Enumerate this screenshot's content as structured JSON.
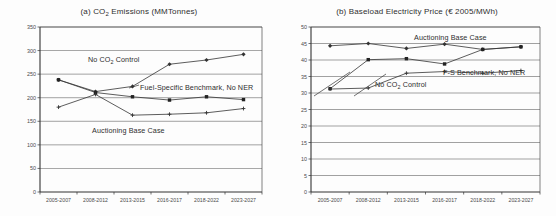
{
  "figure": {
    "name": "two-panel-line-chart-figure",
    "background": "#fdfdfd",
    "ink_color": "#3a3a3a"
  },
  "panels": [
    {
      "key": "a",
      "title_prefix": "(a) CO",
      "title_sub": "2",
      "title_suffix": " Emissions (MMTonnes)",
      "title_plain": "(a) CO2 Emissions (MMTonnes)",
      "series_labels": [
        {
          "text_prefix": "No CO",
          "text_sub": "2",
          "text_suffix": " Control",
          "text_plain": "No CO2 Control",
          "left": 88,
          "top": 55
        },
        {
          "text_prefix": "Fuel-Specific Benchmark, No NER",
          "text_sub": "",
          "text_suffix": "",
          "text_plain": "Fuel-Specific Benchmark, No NER",
          "left": 140,
          "top": 83
        },
        {
          "text_prefix": "Auctioning Base Case",
          "text_sub": "",
          "text_suffix": "",
          "text_plain": "Auctioning Base Case",
          "left": 92,
          "top": 126
        }
      ]
    },
    {
      "key": "b",
      "title_prefix": "(b) Baseload Electricity Price (",
      "title_sub": "",
      "title_suffix": "€ 2005/MWh)",
      "title_plain": "(b) Baseload Electricity Price (€ 2005/MWh)",
      "series_labels": [
        {
          "text_prefix": "Auctioning Base Case",
          "text_sub": "",
          "text_suffix": "",
          "text_plain": "Auctioning Base Case",
          "left": 414,
          "top": 33
        },
        {
          "text_prefix": "F-S Benchmark, No NER",
          "text_sub": "",
          "text_suffix": "",
          "text_plain": "F-S Benchmark, No NER",
          "left": 443,
          "top": 68
        },
        {
          "text_prefix": "No CO",
          "text_sub": "2",
          "text_suffix": " Control",
          "text_plain": "No CO2 Control",
          "left": 375,
          "top": 80
        }
      ]
    }
  ],
  "chart_data": [
    {
      "type": "line",
      "panel": "a",
      "title": "(a) CO2 Emissions (MMTonnes)",
      "xlabel": "",
      "ylabel": "",
      "categories": [
        "2005-2007",
        "2008-2012",
        "2013-2015",
        "2016-2017",
        "2018-2022",
        "2023-2027"
      ],
      "ylim": [
        0,
        350
      ],
      "ytick_step": 50,
      "yticks": [
        0,
        50,
        100,
        150,
        200,
        250,
        300,
        350
      ],
      "grid": true,
      "legend_position": "inline-annotations",
      "series": [
        {
          "name": "No CO2 Control",
          "marker": "diamond",
          "values": [
            238,
            213,
            224,
            271,
            280,
            292
          ]
        },
        {
          "name": "Fuel-Specific Benchmark, No NER",
          "marker": "square",
          "values": [
            238,
            211,
            202,
            195,
            202,
            196
          ]
        },
        {
          "name": "Auctioning Base Case",
          "marker": "cross",
          "values": [
            180,
            207,
            163,
            165,
            168,
            177
          ]
        }
      ]
    },
    {
      "type": "line",
      "panel": "b",
      "title": "(b) Baseload Electricity Price (€ 2005/MWh)",
      "xlabel": "",
      "ylabel": "",
      "categories": [
        "2005-2007",
        "2008-2012",
        "2013-2015",
        "2016-2017",
        "2018-2022",
        "2023-2027"
      ],
      "ylim": [
        0,
        50
      ],
      "ytick_step": 5,
      "yticks": [
        0,
        5,
        10,
        15,
        20,
        25,
        30,
        35,
        40,
        45,
        50
      ],
      "grid": true,
      "legend_position": "inline-annotations",
      "series": [
        {
          "name": "Auctioning Base Case",
          "marker": "diamond",
          "values": [
            44.3,
            45.0,
            43.5,
            44.8,
            43.2,
            44.0
          ]
        },
        {
          "name": "F-S Benchmark, No NER",
          "marker": "square",
          "values": [
            31.3,
            40.1,
            40.4,
            38.8,
            43.2,
            44.0
          ]
        },
        {
          "name": "No CO2 Control",
          "marker": "cross",
          "values": [
            31.2,
            31.5,
            36.0,
            36.5,
            36.0,
            36.8
          ]
        }
      ]
    }
  ]
}
